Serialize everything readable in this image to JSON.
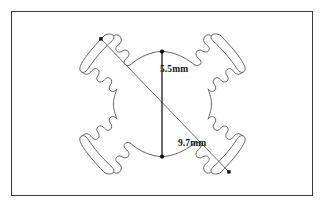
{
  "figure": {
    "background_color": "#ffffff",
    "frame": {
      "name": "figure-border",
      "stroke_color": "#3a3a3c",
      "stroke_width": 1.2,
      "x": 11,
      "y": 11,
      "width": 302,
      "height": 185
    },
    "drawing": {
      "name": "four-arm-cross-outline",
      "stroke_color": "#4a4a4a",
      "fill": "none",
      "stroke_width": 0.8,
      "arm_count": 4,
      "arm_tip_style": "curved-arc-blade",
      "profile_style": "wavy-scalloped"
    },
    "dimensions": [
      {
        "id": "vertical-height",
        "label": "5.5mm",
        "value": 5.5,
        "unit": "mm",
        "orientation": "vertical",
        "line_color": "#101010",
        "endpoint_marker": "dot",
        "x1": 162,
        "y1": 51,
        "x2": 162,
        "y2": 157,
        "label_x": 160,
        "label_y": 65
      },
      {
        "id": "diagonal-span",
        "label": "9.7mm",
        "value": 9.7,
        "unit": "mm",
        "orientation": "diagonal",
        "line_color": "#5a5a5a",
        "endpoint_marker": "square-dot",
        "x1": 101,
        "y1": 39,
        "x2": 229,
        "y2": 172,
        "label_x": 178,
        "label_y": 139
      }
    ]
  }
}
